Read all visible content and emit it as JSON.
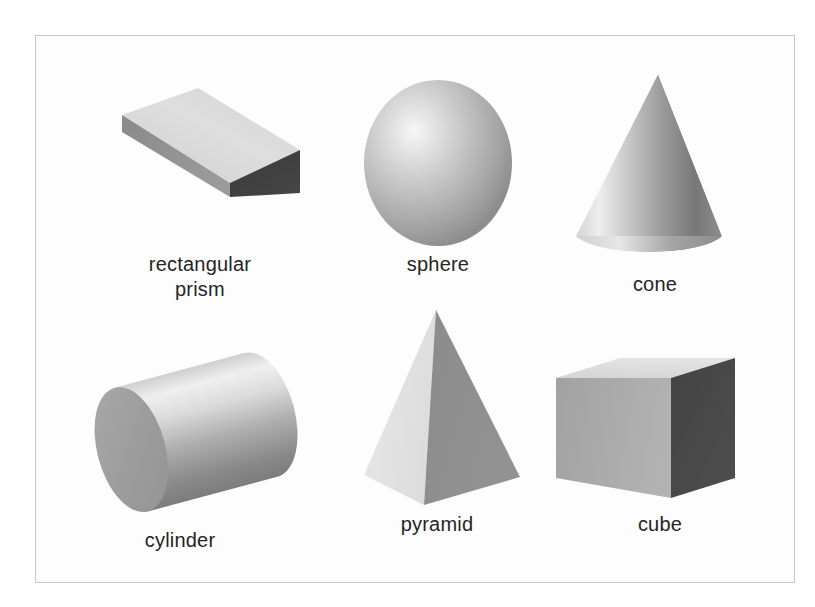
{
  "figure": {
    "title_visible": false,
    "background_color": "#ffffff",
    "frame_color": "#c9c9c9",
    "label_color": "#252525"
  },
  "shapes": [
    {
      "id": "rectangular-prism",
      "name": "rectangular-prism",
      "label": "rectangular\nprism",
      "row": 1,
      "column": 1,
      "faces": {
        "top": "#d8d8d8",
        "side": "#8f8f8f",
        "front": "#3d3d3d"
      }
    },
    {
      "id": "sphere",
      "name": "sphere",
      "label": "sphere",
      "row": 1,
      "column": 2,
      "faces": {
        "highlight": "#f2f2f2",
        "mid": "#b6b6b6",
        "shadow": "#8a8a8a"
      }
    },
    {
      "id": "cone",
      "name": "cone",
      "label": "cone",
      "row": 1,
      "column": 3,
      "faces": {
        "highlight": "#ededed",
        "mid": "#b9b9b9",
        "shadow": "#6f6f6f"
      }
    },
    {
      "id": "cylinder",
      "name": "cylinder",
      "label": "cylinder",
      "row": 2,
      "column": 1,
      "faces": {
        "end_cap": "#9d9d9d",
        "highlight": "#efefef",
        "shadow": "#7b7b7b"
      }
    },
    {
      "id": "pyramid",
      "name": "pyramid",
      "label": "pyramid",
      "row": 2,
      "column": 2,
      "faces": {
        "left": "#e2e2e2",
        "right": "#8c8c8c"
      }
    },
    {
      "id": "cube",
      "name": "cube",
      "label": "cube",
      "row": 2,
      "column": 3,
      "faces": {
        "top": "#dcdcdc",
        "side": "#a8a8a8",
        "front": "#484848"
      }
    }
  ],
  "labels": {
    "rectangular_prism": "rectangular\nprism",
    "sphere": "sphere",
    "cone": "cone",
    "cylinder": "cylinder",
    "pyramid": "pyramid",
    "cube": "cube"
  }
}
